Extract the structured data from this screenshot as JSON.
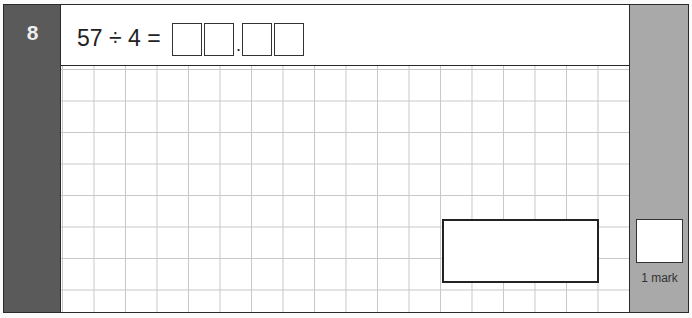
{
  "question": {
    "number": "8",
    "expression": "57 ÷ 4 =",
    "answer_digit_boxes": 4,
    "decimal_point": ".",
    "answer_box_value": ""
  },
  "marks": {
    "label": "1 mark",
    "box_value": ""
  },
  "colors": {
    "question_bar": "#5a5a5a",
    "mark_panel": "#a9a9a9",
    "grid_lines": "#c8c8c8"
  }
}
